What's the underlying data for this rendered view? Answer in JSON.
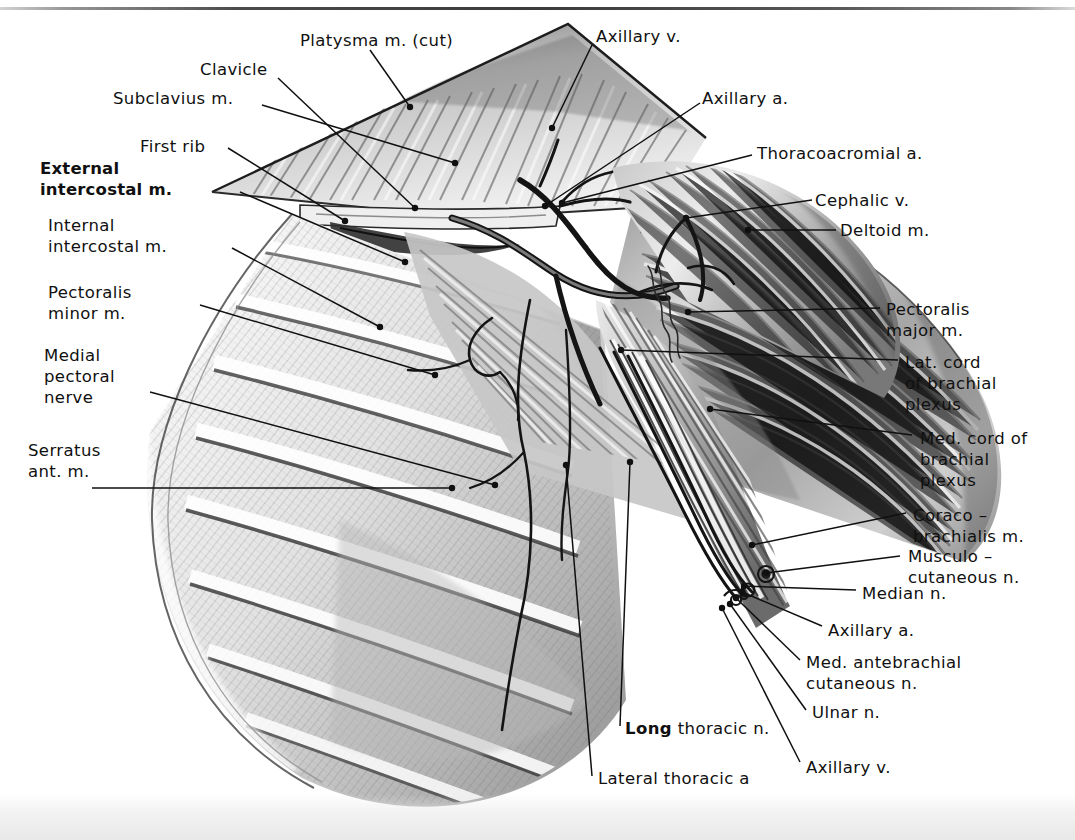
{
  "plate": {
    "domain": "anatomical-illustration",
    "title": "Axilla and pectoral region dissection",
    "width": 1075,
    "height": 840,
    "style": "grayscale pencil and wash medical illustration",
    "background_color": "#ffffff",
    "ink_color": "#101010"
  },
  "labels": [
    {
      "id": "platysma",
      "text": "Platysma m. (cut)",
      "x": 300,
      "y": 30,
      "align": "left",
      "bold": false
    },
    {
      "id": "clavicle",
      "text": "Clavicle",
      "x": 200,
      "y": 59,
      "align": "left",
      "bold": false
    },
    {
      "id": "subclavius",
      "text": "Subclavius m.",
      "x": 113,
      "y": 88,
      "align": "left",
      "bold": false
    },
    {
      "id": "first-rib",
      "text": "First rib",
      "x": 140,
      "y": 136,
      "align": "left",
      "bold": false
    },
    {
      "id": "ext-intercostal",
      "text": "External\nintercostal m.",
      "x": 40,
      "y": 158,
      "align": "left",
      "bold": true
    },
    {
      "id": "int-intercostal",
      "text": "Internal\nintercostal m.",
      "x": 48,
      "y": 215,
      "align": "left",
      "bold": false
    },
    {
      "id": "pect-minor",
      "text": "Pectoralis\nminor m.",
      "x": 48,
      "y": 282,
      "align": "left",
      "bold": false
    },
    {
      "id": "med-pect-nerve",
      "text": "Medial\npectoral\nnerve",
      "x": 44,
      "y": 345,
      "align": "left",
      "bold": false
    },
    {
      "id": "serratus",
      "text": "Serratus\nant. m.",
      "x": 28,
      "y": 440,
      "align": "left",
      "bold": false
    },
    {
      "id": "axillary-v-top",
      "text": "Axillary v.",
      "x": 596,
      "y": 26,
      "align": "left",
      "bold": false
    },
    {
      "id": "axillary-a-top",
      "text": "Axillary a.",
      "x": 702,
      "y": 88,
      "align": "left",
      "bold": false
    },
    {
      "id": "thoracoacromial",
      "text": "Thoracoacromial a.",
      "x": 757,
      "y": 143,
      "align": "left",
      "bold": false
    },
    {
      "id": "cephalic-v",
      "text": "Cephalic v.",
      "x": 815,
      "y": 190,
      "align": "left",
      "bold": false
    },
    {
      "id": "deltoid",
      "text": "Deltoid m.",
      "x": 840,
      "y": 220,
      "align": "left",
      "bold": false
    },
    {
      "id": "pect-major",
      "text": "Pectoralis\nmajor m.",
      "x": 886,
      "y": 299,
      "align": "left",
      "bold": false
    },
    {
      "id": "lat-cord",
      "text": "Lat. cord\nof brachial\nplexus",
      "x": 905,
      "y": 352,
      "align": "left",
      "bold": false
    },
    {
      "id": "med-cord",
      "text": "Med. cord of\nbrachial\nplexus",
      "x": 920,
      "y": 428,
      "align": "left",
      "bold": false
    },
    {
      "id": "coracobrachialis",
      "text": "Coraco –\nbrachialis m.",
      "x": 913,
      "y": 505,
      "align": "left",
      "bold": false
    },
    {
      "id": "musculocutaneous",
      "text": "Musculo –\ncutaneous n.",
      "x": 908,
      "y": 546,
      "align": "left",
      "bold": false
    },
    {
      "id": "median-n",
      "text": "Median n.",
      "x": 862,
      "y": 583,
      "align": "left",
      "bold": false
    },
    {
      "id": "axillary-a-low",
      "text": "Axillary a.",
      "x": 828,
      "y": 620,
      "align": "left",
      "bold": false
    },
    {
      "id": "med-antebrachial",
      "text": "Med. antebrachial\ncutaneous n.",
      "x": 806,
      "y": 652,
      "align": "left",
      "bold": false
    },
    {
      "id": "ulnar-n",
      "text": "Ulnar n.",
      "x": 812,
      "y": 702,
      "align": "left",
      "bold": false
    },
    {
      "id": "axillary-v-low",
      "text": "Axillary v.",
      "x": 806,
      "y": 757,
      "align": "left",
      "bold": false
    },
    {
      "id": "long-thoracic",
      "text": "Long thoracic n.",
      "bold_prefix": "Long",
      "rest": " thoracic n.",
      "x": 625,
      "y": 718,
      "align": "left",
      "bold": false
    },
    {
      "id": "lateral-thoracic",
      "text": "Lateral thoracic a",
      "x": 598,
      "y": 768,
      "align": "left",
      "bold": false
    }
  ],
  "leaders": [
    {
      "for": "platysma",
      "points": "370,50 410,107",
      "dot": "410,107"
    },
    {
      "for": "clavicle",
      "points": "278,78 415,208",
      "dot": "415,208"
    },
    {
      "for": "subclavius",
      "points": "262,105 455,163",
      "dot": "455,163"
    },
    {
      "for": "first-rib",
      "points": "228,148 345,221",
      "dot": "345,221"
    },
    {
      "for": "ext-intercostal",
      "points": "240,192 405,262",
      "dot": "405,262"
    },
    {
      "for": "int-intercostal",
      "points": "232,248 380,327",
      "dot": "380,327"
    },
    {
      "for": "pect-minor",
      "points": "200,305 435,375",
      "dot": "435,375"
    },
    {
      "for": "med-pect-nerve",
      "points": "150,392 495,485",
      "dot": "495,485"
    },
    {
      "for": "serratus",
      "points": "92,488 452,488",
      "dot": "452,488"
    },
    {
      "for": "axillary-v-top",
      "points": "592,45 552,128",
      "dot": "552,128"
    },
    {
      "for": "axillary-a-top",
      "points": "700,103 545,206",
      "dot": "545,206"
    },
    {
      "for": "thoracoacromial",
      "points": "752,155 562,203",
      "dot": "562,203"
    },
    {
      "for": "cephalic-v",
      "points": "812,200 686,218",
      "dot": "686,218"
    },
    {
      "for": "deltoid",
      "points": "836,230 748,230",
      "dot": "748,230"
    },
    {
      "for": "pect-major",
      "points": "880,308 688,312",
      "dot": "688,312"
    },
    {
      "for": "lat-cord",
      "points": "898,360 621,350",
      "dot": "621,350"
    },
    {
      "for": "med-cord",
      "points": "912,435 710,409",
      "dot": "710,409"
    },
    {
      "for": "coracobrachialis",
      "points": "906,513 752,545",
      "dot": "752,545"
    },
    {
      "for": "musculocutaneous",
      "points": "900,556 766,573",
      "dot": "766,573"
    },
    {
      "for": "median-n",
      "points": "856,590 744,586",
      "dot": "744,586"
    },
    {
      "for": "axillary-a-low",
      "points": "822,626 742,592",
      "dot": "742,592"
    },
    {
      "for": "med-antebrachial",
      "points": "800,660 736,598",
      "dot": "736,598"
    },
    {
      "for": "ulnar-n",
      "points": "806,710 730,604",
      "dot": "730,604"
    },
    {
      "for": "axillary-v-low",
      "points": "800,762 722,608",
      "dot": "722,608"
    },
    {
      "for": "long-thoracic",
      "points": "620,726 630,462",
      "dot": "630,462"
    },
    {
      "for": "lateral-thoracic",
      "points": "592,776 566,465",
      "dot": "566,465"
    }
  ]
}
